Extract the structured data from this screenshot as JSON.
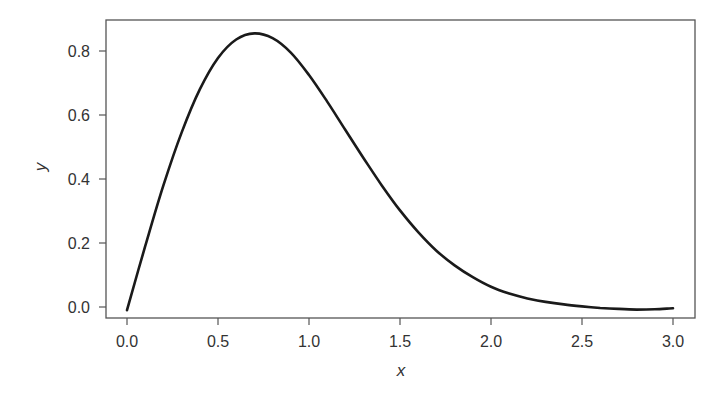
{
  "chart_data": {
    "type": "line",
    "title": "",
    "xlabel": "x",
    "ylabel": "y",
    "xlim": [
      -0.12,
      3.12
    ],
    "ylim": [
      -0.035,
      0.895
    ],
    "grid": false,
    "legend": null,
    "x_ticks": [
      0.0,
      0.5,
      1.0,
      1.5,
      2.0,
      2.5,
      3.0
    ],
    "x_tick_labels": [
      "0.0",
      "0.5",
      "1.0",
      "1.5",
      "2.0",
      "2.5",
      "3.0"
    ],
    "y_ticks": [
      0.0,
      0.2,
      0.4,
      0.6,
      0.8
    ],
    "y_tick_labels": [
      "0.0",
      "0.2",
      "0.4",
      "0.6",
      "0.8"
    ],
    "series": [
      {
        "name": "y",
        "color": "#1a1a1a",
        "x": [
          0.0,
          0.1,
          0.2,
          0.3,
          0.4,
          0.5,
          0.6,
          0.7,
          0.8,
          0.9,
          1.0,
          1.1,
          1.2,
          1.3,
          1.4,
          1.5,
          1.6,
          1.7,
          1.8,
          1.9,
          2.0,
          2.1,
          2.2,
          2.3,
          2.4,
          2.5,
          2.6,
          2.7,
          2.8,
          2.9,
          3.0
        ],
        "y": [
          -0.01,
          0.19,
          0.38,
          0.545,
          0.68,
          0.778,
          0.836,
          0.855,
          0.84,
          0.795,
          0.725,
          0.642,
          0.553,
          0.465,
          0.38,
          0.302,
          0.234,
          0.176,
          0.13,
          0.093,
          0.063,
          0.042,
          0.027,
          0.016,
          0.008,
          0.002,
          -0.003,
          -0.006,
          -0.008,
          -0.007,
          -0.004
        ]
      }
    ]
  }
}
